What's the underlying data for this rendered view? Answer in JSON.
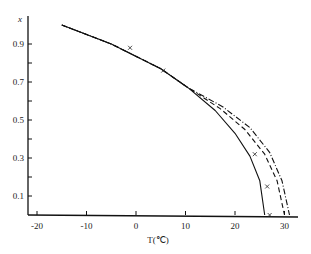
{
  "chart_data": {
    "type": "line",
    "title": "",
    "xlabel": "T(℃)",
    "ylabel": "x",
    "xlim": [
      -22,
      32
    ],
    "ylim": [
      0,
      1.0
    ],
    "x_ticks": [
      "-20",
      "-10",
      "0",
      "10",
      "20",
      "30"
    ],
    "y_ticks": [
      "0.1",
      "0.3",
      "0.5",
      "0.7",
      "0.9"
    ],
    "grid": false,
    "legend": null,
    "series": [
      {
        "name": "solid",
        "style": "solid",
        "points": [
          [
            -15,
            1.0
          ],
          [
            -5,
            0.9
          ],
          [
            5,
            0.77
          ],
          [
            10.5,
            0.67
          ],
          [
            16,
            0.55
          ],
          [
            20,
            0.43
          ],
          [
            23,
            0.31
          ],
          [
            25,
            0.18
          ],
          [
            26,
            0.0
          ]
        ]
      },
      {
        "name": "dashed",
        "style": "dashed",
        "points": [
          [
            -15,
            1.0
          ],
          [
            -5,
            0.9
          ],
          [
            5,
            0.77
          ],
          [
            10.5,
            0.67
          ],
          [
            17,
            0.56
          ],
          [
            22,
            0.45
          ],
          [
            26,
            0.32
          ],
          [
            28.5,
            0.18
          ],
          [
            30,
            0.0
          ]
        ]
      },
      {
        "name": "dash-dot",
        "style": "dashdot",
        "points": [
          [
            -15,
            1.0
          ],
          [
            -5,
            0.9
          ],
          [
            5,
            0.77
          ],
          [
            10.5,
            0.67
          ],
          [
            17.5,
            0.57
          ],
          [
            23,
            0.46
          ],
          [
            27,
            0.33
          ],
          [
            29.5,
            0.18
          ],
          [
            31,
            0.0
          ]
        ]
      },
      {
        "name": "experimental",
        "style": "cross",
        "points": [
          [
            -1.2,
            0.88
          ],
          [
            5.5,
            0.76
          ],
          [
            24,
            0.32
          ],
          [
            26.5,
            0.15
          ],
          [
            27,
            0.0
          ]
        ]
      }
    ]
  }
}
